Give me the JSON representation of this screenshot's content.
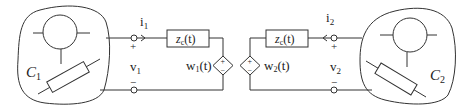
{
  "diagram": {
    "left": {
      "circuit_label": "C",
      "circuit_sub": "1",
      "current_label": "i",
      "current_sub": "1",
      "voltage_label": "v",
      "voltage_sub": "1",
      "plus": "+",
      "minus": "−",
      "impedance_label": "z",
      "impedance_sub": "c",
      "impedance_arg": "(t)",
      "source_label": "w",
      "source_sub": "1",
      "source_arg": "(t)",
      "source_plus": "+",
      "source_minus": "−"
    },
    "right": {
      "circuit_label": "C",
      "circuit_sub": "2",
      "current_label": "i",
      "current_sub": "2",
      "voltage_label": "v",
      "voltage_sub": "2",
      "plus": "+",
      "minus": "−",
      "impedance_label": "z",
      "impedance_sub": "c",
      "impedance_arg": "(t)",
      "source_label": "w",
      "source_sub": "2",
      "source_arg": "(t)",
      "source_plus": "+",
      "source_minus": "−"
    },
    "colors": {
      "line": "#333333",
      "background": "#ffffff"
    }
  }
}
